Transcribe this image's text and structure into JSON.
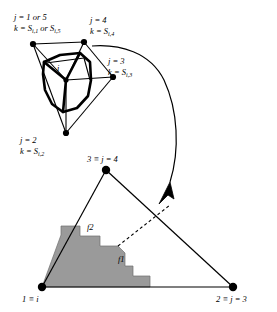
{
  "figure": {
    "title": "",
    "panels": {
      "top": {
        "name": "node-neighborhood-polygon",
        "center_label": "i",
        "vertex_labels": [
          {
            "id": "v1",
            "line1": "j = 1 or 5",
            "line2": "k = S",
            "sub2a": "i,1",
            "mid2": " or S",
            "sub2b": "i,5"
          },
          {
            "id": "v4",
            "line1": "j = 4",
            "line2": "k = S",
            "sub2a": "i,4",
            "mid2": "",
            "sub2b": ""
          },
          {
            "id": "v3",
            "line1": "j = 3",
            "line2": "k = S",
            "sub2a": "i,3",
            "mid2": "",
            "sub2b": ""
          },
          {
            "id": "v2",
            "line1": "j = 2",
            "line2": "k = S",
            "sub2a": "i,2",
            "mid2": "",
            "sub2b": ""
          }
        ]
      },
      "bottom": {
        "name": "triangle-element",
        "vertex_labels": [
          {
            "id": "t1",
            "text": "1 ≡ i"
          },
          {
            "id": "t2",
            "text": "2 ≡ j = 3"
          },
          {
            "id": "t3",
            "text": "3 ≡ j = 4"
          }
        ],
        "face_labels": [
          {
            "id": "f1",
            "text": "f1"
          },
          {
            "id": "f2",
            "text": "f2"
          }
        ]
      }
    },
    "colors": {
      "stroke": "#000000",
      "shade_fill": "#9a9a9a",
      "background": "#ffffff"
    }
  }
}
